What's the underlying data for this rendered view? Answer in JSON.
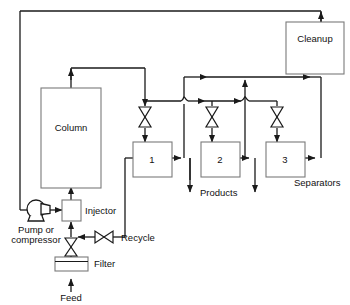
{
  "diagram": {
    "type": "process-flow-diagram",
    "colors": {
      "line": "#1a1a1a",
      "box_stroke": "#7a7a7a",
      "box_fill": "#ffffff",
      "text": "#111111",
      "background": "#ffffff"
    },
    "units": {
      "column": {
        "label": "Column"
      },
      "cleanup": {
        "label": "Cleanup"
      },
      "injector": {
        "label": "Injector"
      },
      "filter": {
        "label": "Filter"
      },
      "pump": {
        "label_line1": "Pump or",
        "label_line2": "compressor"
      },
      "separator_1": {
        "label": "1"
      },
      "separator_2": {
        "label": "2"
      },
      "separator_3": {
        "label": "3"
      }
    },
    "stream_labels": {
      "feed": "Feed",
      "recycle": "Recycle",
      "products": "Products",
      "separators": "Separators"
    },
    "valves": [
      {
        "name": "valve-separator-1",
        "orientation": "vertical"
      },
      {
        "name": "valve-separator-2",
        "orientation": "vertical"
      },
      {
        "name": "valve-separator-3",
        "orientation": "vertical"
      },
      {
        "name": "valve-recycle",
        "orientation": "horizontal"
      },
      {
        "name": "valve-feed",
        "orientation": "vertical"
      }
    ]
  }
}
